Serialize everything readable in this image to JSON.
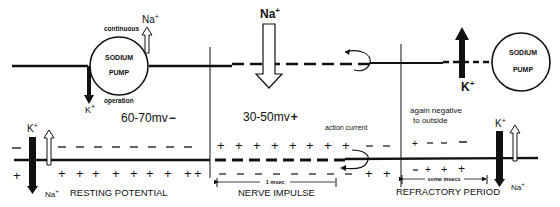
{
  "diagram": {
    "top_pump_left": {
      "line1": "SODIUM",
      "line2": "PUMP",
      "label_top": "continuous",
      "label_bottom": "operation",
      "ion_out": "Na",
      "ion_in": "K",
      "sup": "+"
    },
    "top_pump_right": {
      "line1": "SODIUM",
      "line2": "PUMP"
    },
    "top_influx": {
      "ion": "Na",
      "sup": "+"
    },
    "top_efflux": {
      "ion": "K",
      "sup": "+"
    },
    "voltages": {
      "resting": "60-70mv",
      "resting_sign": "−",
      "impulse": "30-50mv",
      "impulse_sign": "+"
    },
    "labels": {
      "action_current": "action current",
      "again_negative_1": "again negative",
      "again_negative_2": "to outside",
      "msec": "1 msec",
      "some_msecs": "some msecs"
    },
    "sections": {
      "resting": "RESTING POTENTIAL",
      "impulse": "NERVE IMPULSE",
      "refractory": "REFRACTORY PERIOD"
    },
    "bottom_left_channel": {
      "ion_top": "K",
      "ion_bottom": "Na",
      "sup": "+"
    },
    "bottom_right_channel": {
      "ion_top": "K",
      "ion_bottom": "Na",
      "sup": "+"
    },
    "charges": {
      "minus": "−",
      "plus": "+"
    }
  }
}
